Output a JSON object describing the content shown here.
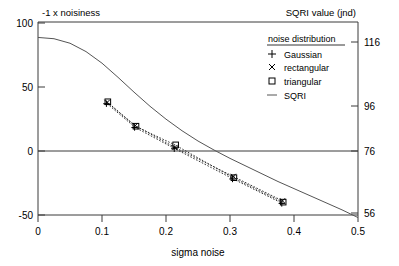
{
  "chart_data": {
    "type": "line",
    "title": "",
    "xlabel": "sigma noise",
    "ylabel_left": "-1 x noisiness",
    "ylabel_right": "SQRI value (jnd)",
    "xlim": [
      0,
      0.5
    ],
    "ylim_left": [
      -50,
      100
    ],
    "ylim_right": [
      56,
      116
    ],
    "xticks": [
      0,
      0.1,
      0.2,
      0.3,
      0.4,
      0.5
    ],
    "xtick_labels": [
      "0",
      "0.1",
      "0.2",
      "0.3",
      "0.4",
      "0.5"
    ],
    "yticks_left": [
      -50,
      0,
      50,
      100
    ],
    "ytick_labels_left": [
      "-50",
      "0",
      "50",
      "100"
    ],
    "yticks_right": [
      56,
      76,
      96,
      116
    ],
    "ytick_labels_right": [
      "56",
      "76",
      "96",
      "116"
    ],
    "grid": false,
    "zero_line": true,
    "legend_position": "top-right",
    "legend_title": "noise distribution",
    "series": [
      {
        "name": "Gaussian",
        "marker": "plus",
        "linestyle": "dotted",
        "x": [
          0.108,
          0.152,
          0.214,
          0.305,
          0.382
        ],
        "y": [
          36.5,
          18.0,
          1.5,
          -22.0,
          -41.0
        ]
      },
      {
        "name": "rectangular",
        "marker": "cross",
        "linestyle": "dotted",
        "x": [
          0.108,
          0.152,
          0.214,
          0.305,
          0.382
        ],
        "y": [
          37.5,
          19.5,
          2.5,
          -20.0,
          -39.0
        ]
      },
      {
        "name": "triangular",
        "marker": "square",
        "linestyle": "dotted",
        "x": [
          0.108,
          0.152,
          0.214,
          0.305,
          0.382
        ],
        "y": [
          38.0,
          19.0,
          4.5,
          -21.0,
          -40.0
        ]
      },
      {
        "name": "SQRI",
        "marker": "none",
        "linestyle": "solid",
        "x": [
          0.0,
          0.025,
          0.05,
          0.075,
          0.1,
          0.125,
          0.15,
          0.175,
          0.2,
          0.225,
          0.25,
          0.275,
          0.3,
          0.325,
          0.35,
          0.375,
          0.4,
          0.425,
          0.45,
          0.475,
          0.5
        ],
        "y": [
          88.0,
          87.0,
          83.5,
          77.0,
          68.0,
          57.0,
          45.5,
          34.5,
          24.5,
          15.5,
          7.5,
          0.5,
          -6.0,
          -12.0,
          -18.0,
          -24.0,
          -29.5,
          -35.0,
          -40.5,
          -46.0,
          -52.0
        ]
      }
    ]
  },
  "legend": {
    "title": "noise distribution",
    "entries": [
      {
        "label": "Gaussian",
        "symbol": "plus-marker-icon"
      },
      {
        "label": "rectangular",
        "symbol": "cross-marker-icon"
      },
      {
        "label": "triangular",
        "symbol": "square-marker-icon"
      },
      {
        "label": "SQRI",
        "symbol": "line-marker-icon"
      }
    ]
  },
  "labels": {
    "top_left": "-1 x noisiness",
    "top_right": "SQRI value (jnd)",
    "x_axis": "sigma noise"
  },
  "colors": {
    "axis": "#000000",
    "curve": "#555555",
    "marker": "#000000",
    "background": "#ffffff"
  }
}
